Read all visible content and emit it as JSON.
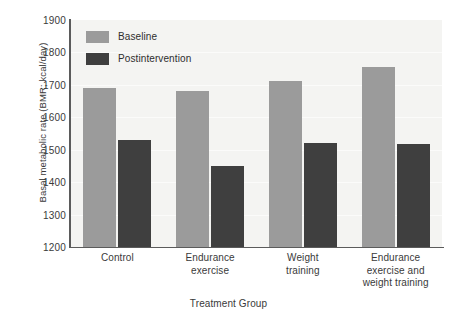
{
  "chart_data": {
    "type": "bar",
    "title": "",
    "xlabel": "Treatment Group",
    "ylabel": "Basal metabolic rate (BMR; kcal/day)",
    "categories": [
      "Control",
      "Endurance exercise",
      "Weight training",
      "Endurance exercise and weight training"
    ],
    "category_lines": [
      [
        "Control"
      ],
      [
        "Endurance",
        "exercise"
      ],
      [
        "Weight",
        "training"
      ],
      [
        "Endurance",
        "exercise and",
        "weight training"
      ]
    ],
    "series": [
      {
        "name": "Baseline",
        "color": "#9b9b9b",
        "values": [
          1690,
          1680,
          1712,
          1755
        ]
      },
      {
        "name": "Postintervention",
        "color": "#3f3f3f",
        "values": [
          1530,
          1450,
          1520,
          1518
        ]
      }
    ],
    "ylim": [
      1200,
      1900
    ],
    "ytick_values": [
      1200,
      1300,
      1400,
      1500,
      1600,
      1700,
      1800,
      1900
    ],
    "ytick_labels": [
      "1200",
      "1300",
      "1400",
      "1500",
      "1600",
      "1700",
      "1800",
      "1900"
    ],
    "grid": true,
    "legend_position": "upper-left",
    "plot_background": "#f4f4f2",
    "axis_color": "#5b5b5b"
  },
  "legend": {
    "items": [
      {
        "label": "Baseline",
        "swatch": "baseline"
      },
      {
        "label": "Postintervention",
        "swatch": "post"
      }
    ]
  }
}
